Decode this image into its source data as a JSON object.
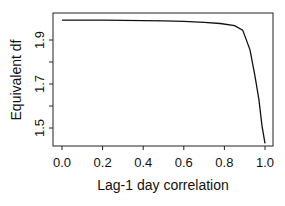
{
  "chart_data": {
    "type": "line",
    "title": "",
    "xlabel": "Lag-1 day correlation",
    "ylabel": "Equivalent df",
    "xlim": [
      0.0,
      1.0
    ],
    "ylim": [
      1.43,
      2.02
    ],
    "grid": false,
    "legend": null,
    "x_ticks": [
      "0.0",
      "0.2",
      "0.4",
      "0.6",
      "0.8",
      "1.0"
    ],
    "y_ticks": [
      "1.5",
      "1.7",
      "1.9"
    ],
    "series": [
      {
        "name": "Equivalent df",
        "x": [
          0.0,
          0.2,
          0.4,
          0.5,
          0.6,
          0.7,
          0.78,
          0.85,
          0.89,
          0.926,
          0.95,
          0.97,
          0.985,
          1.0
        ],
        "y": [
          1.99,
          1.99,
          1.988,
          1.987,
          1.985,
          1.98,
          1.975,
          1.965,
          1.945,
          1.855,
          1.74,
          1.63,
          1.51,
          1.43
        ]
      }
    ],
    "colors": {
      "line": "#111111",
      "axis": "#222222",
      "background": "#ffffff"
    }
  }
}
